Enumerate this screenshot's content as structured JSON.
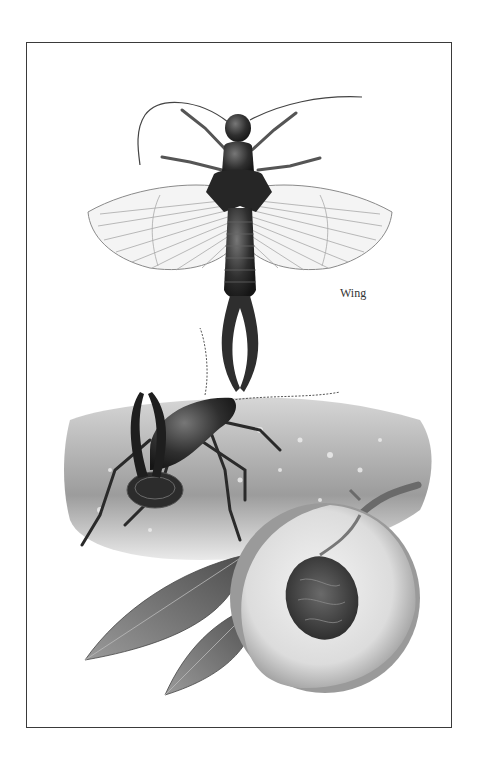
{
  "plate": {
    "subject": "Earwig illustration with peach",
    "labels": {
      "wing": "Wing"
    }
  },
  "palette": {
    "background": "#ffffff",
    "border": "#3a3a3a",
    "insect_dark": "#2a2a2a",
    "wing_fill": "#f4f4f4",
    "wing_vein": "#9a9a9a",
    "ground": "#b8b8b8",
    "peach_flesh": "#e6e6e6",
    "peach_skin": "#8a8a8a",
    "pit": "#4a4a4a",
    "leaf": "#6e6e6e"
  }
}
